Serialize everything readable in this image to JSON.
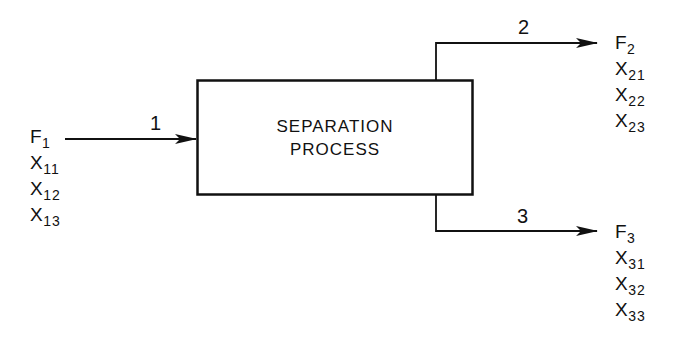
{
  "process": {
    "line1": "SEPARATION",
    "line2": "PROCESS"
  },
  "streams": [
    {
      "number": "1",
      "direction": "inlet",
      "flow": {
        "symbol": "F",
        "sub": "1"
      },
      "compositions": [
        {
          "symbol": "X",
          "sub": "11"
        },
        {
          "symbol": "X",
          "sub": "12"
        },
        {
          "symbol": "X",
          "sub": "13"
        }
      ]
    },
    {
      "number": "2",
      "direction": "outlet",
      "flow": {
        "symbol": "F",
        "sub": "2"
      },
      "compositions": [
        {
          "symbol": "X",
          "sub": "21"
        },
        {
          "symbol": "X",
          "sub": "22"
        },
        {
          "symbol": "X",
          "sub": "23"
        }
      ]
    },
    {
      "number": "3",
      "direction": "outlet",
      "flow": {
        "symbol": "F",
        "sub": "3"
      },
      "compositions": [
        {
          "symbol": "X",
          "sub": "31"
        },
        {
          "symbol": "X",
          "sub": "32"
        },
        {
          "symbol": "X",
          "sub": "33"
        }
      ]
    }
  ]
}
